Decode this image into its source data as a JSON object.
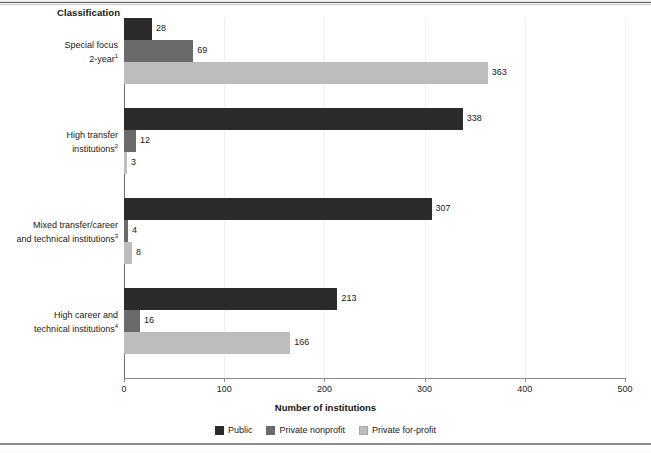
{
  "header": {
    "classification_label": "Classification"
  },
  "chart_data": {
    "type": "bar",
    "orientation": "horizontal",
    "title": "",
    "xlabel": "Number of institutions",
    "ylabel": "Classification",
    "xlim": [
      0,
      500
    ],
    "xticks": [
      0,
      100,
      200,
      300,
      400,
      500
    ],
    "grid": "vertical-faint",
    "legend_position": "bottom-center",
    "categories": [
      "Special focus 2-year",
      "High transfer institutions",
      "Mixed transfer/career and technical institutions",
      "High career and technical institutions"
    ],
    "category_lines": [
      [
        "Special focus",
        "2-year"
      ],
      [
        "High transfer",
        "institutions"
      ],
      [
        "Mixed transfer/career",
        "and technical institutions"
      ],
      [
        "High career and",
        "technical institutions"
      ]
    ],
    "category_footnotes": [
      "1",
      "2",
      "3",
      "4"
    ],
    "series": [
      {
        "name": "Public",
        "color": "#2b2b2b",
        "values": [
          28,
          338,
          307,
          213
        ]
      },
      {
        "name": "Private nonprofit",
        "color": "#6a6a6a",
        "values": [
          69,
          12,
          4,
          16
        ]
      },
      {
        "name": "Private for-profit",
        "color": "#bdbdbd",
        "values": [
          363,
          3,
          8,
          166
        ]
      }
    ]
  }
}
